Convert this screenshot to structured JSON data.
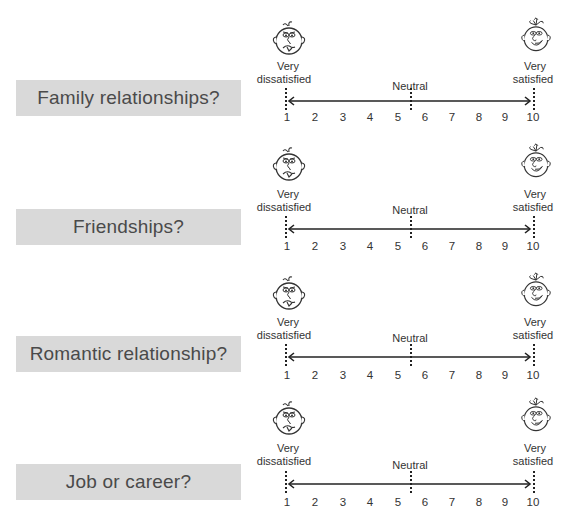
{
  "scale": {
    "left_label_line1": "Very",
    "left_label_line2": "dissatisfied",
    "right_label_line1": "Very",
    "right_label_line2": "satisfied",
    "middle_label": "Neutral",
    "numbers": [
      "1",
      "2",
      "3",
      "4",
      "5",
      "6",
      "7",
      "8",
      "9",
      "10"
    ],
    "left_face": "sad-face-icon",
    "right_face": "happy-face-icon"
  },
  "questions": [
    {
      "label": "Family relationships?"
    },
    {
      "label": "Friendships?"
    },
    {
      "label": "Romantic relationship?"
    },
    {
      "label": "Job or career?"
    }
  ],
  "colors": {
    "box_bg": "#d9d9d9",
    "text": "#4a4a4a",
    "line": "#222222"
  }
}
